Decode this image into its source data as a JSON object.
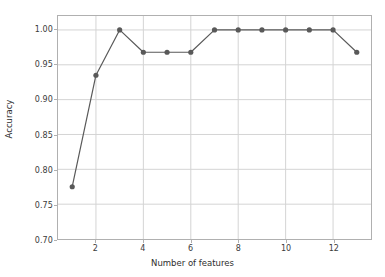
{
  "chart_data": {
    "type": "line",
    "title": "",
    "xlabel": "Number of features",
    "ylabel": "Accuracy",
    "x": [
      1,
      2,
      3,
      4,
      5,
      6,
      7,
      8,
      9,
      10,
      11,
      12,
      13
    ],
    "values": [
      0.775,
      0.935,
      1.0,
      0.968,
      0.968,
      0.968,
      1.0,
      1.0,
      1.0,
      1.0,
      1.0,
      1.0,
      0.968
    ],
    "series": [
      {
        "name": "accuracy",
        "values": [
          0.775,
          0.935,
          1.0,
          0.968,
          0.968,
          0.968,
          1.0,
          1.0,
          1.0,
          1.0,
          1.0,
          1.0,
          0.968
        ]
      }
    ],
    "xlim": [
      0.4,
      13.6
    ],
    "ylim": [
      0.7,
      1.02
    ],
    "xticks": [
      2,
      4,
      6,
      8,
      10,
      12
    ],
    "xtick_labels": [
      "2",
      "4",
      "6",
      "8",
      "10",
      "12"
    ],
    "yticks": [
      0.7,
      0.75,
      0.8,
      0.85,
      0.9,
      0.95,
      1.0
    ],
    "ytick_labels": [
      "0.70",
      "0.75",
      "0.80",
      "0.85",
      "0.90",
      "0.95",
      "1.00"
    ],
    "grid": true,
    "legend": null,
    "line_color": "#595959",
    "marker_color": "#595959",
    "marker": "circle",
    "grid_color": "#d4d4d4",
    "axes_color": "#b0b0b0",
    "background": "#ffffff"
  }
}
